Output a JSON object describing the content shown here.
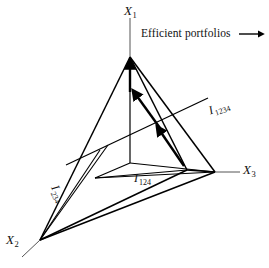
{
  "figure": {
    "background_color": "#ffffff",
    "line_color": "#000000",
    "axes": [
      {
        "id": "x1",
        "label": "X",
        "subscript": "1",
        "name": "axis-label-x1"
      },
      {
        "id": "x2",
        "label": "X",
        "subscript": "2",
        "name": "axis-label-x2"
      },
      {
        "id": "x3",
        "label": "X",
        "subscript": "3",
        "name": "axis-label-x3"
      }
    ],
    "curve_labels": [
      {
        "id": "i1234_right",
        "label": "I",
        "subscript": "1234"
      },
      {
        "id": "i124",
        "label": "I",
        "subscript": "124"
      },
      {
        "id": "i234",
        "label": "I",
        "subscript": "234"
      }
    ],
    "annotations": [
      {
        "id": "efficient",
        "text": "Efficient portfolios",
        "arrow": "right-arrow"
      }
    ],
    "geometry": {
      "origin": [
        130,
        163
      ],
      "apex_x1": [
        130,
        57
      ],
      "vertex_x2": [
        40,
        240
      ],
      "vertex_x3": [
        215,
        172
      ],
      "axis_x1_end": [
        130,
        18
      ],
      "axis_x2_end": [
        22,
        257
      ],
      "axis_x3_end": [
        240,
        172
      ]
    }
  }
}
